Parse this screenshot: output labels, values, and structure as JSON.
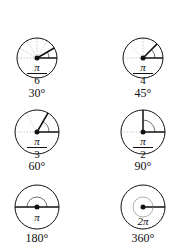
{
  "diagram": {
    "title": "",
    "items": [
      {
        "id": "pi-6",
        "radians_num": "π",
        "radians_den": "6",
        "degrees": "30°",
        "angle_deg": 30,
        "grid_step_deg": 30
      },
      {
        "id": "pi-4",
        "radians_num": "π",
        "radians_den": "4",
        "degrees": "45°",
        "angle_deg": 45,
        "grid_step_deg": 45
      },
      {
        "id": "pi-3",
        "radians_num": "π",
        "radians_den": "3",
        "degrees": "60°",
        "angle_deg": 60,
        "grid_step_deg": 60
      },
      {
        "id": "pi-2",
        "radians_num": "π",
        "radians_den": "2",
        "degrees": "90°",
        "angle_deg": 90,
        "grid_step_deg": 90
      },
      {
        "id": "pi",
        "radians": "π",
        "degrees": "180°",
        "angle_deg": 180
      },
      {
        "id": "2pi",
        "radians": "2π",
        "degrees": "360°",
        "angle_deg": 360
      }
    ],
    "colors": {
      "stroke": "#111111",
      "guide": "#9a9a9a",
      "background": "#ffffff"
    }
  }
}
